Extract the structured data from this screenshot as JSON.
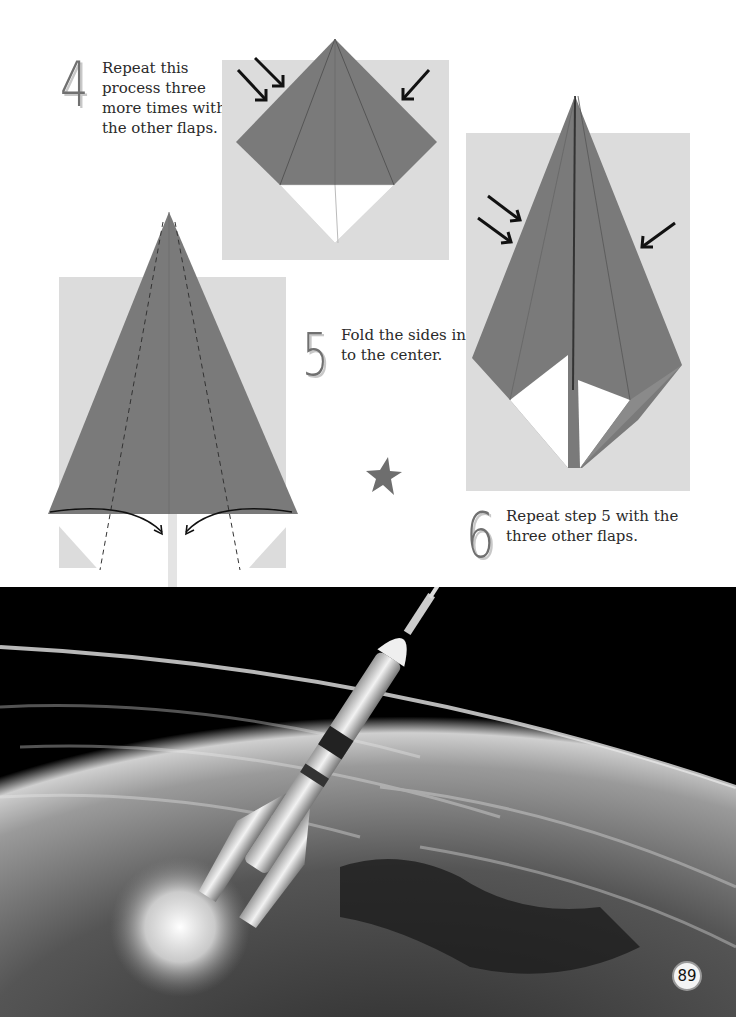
{
  "page": {
    "number": "89",
    "colors": {
      "paper_gray": "#7a7a7a",
      "background_photo": "#dcdcdc",
      "numeral": "#707070",
      "text": "#2a2a2a",
      "space": "#000000"
    }
  },
  "steps": [
    {
      "number": "4",
      "text_lines": [
        "Repeat this",
        "process three",
        "more times with",
        "the other flaps."
      ]
    },
    {
      "number": "5",
      "text_lines": [
        "Fold the sides in",
        "to the center."
      ]
    },
    {
      "number": "6",
      "text_lines": [
        "Repeat step 5 with the",
        "three other flaps."
      ]
    }
  ],
  "decorations": {
    "star_icon": "star-icon",
    "arrow_icon": "arrow-icon"
  },
  "photo": {
    "subject": "rocket launching above Earth"
  }
}
